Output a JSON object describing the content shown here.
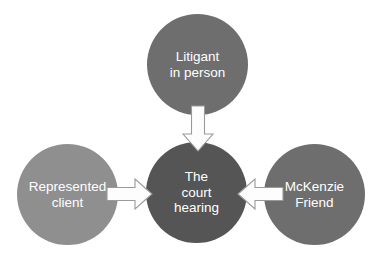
{
  "diagram": {
    "background_color": "#ffffff",
    "text_color": "#ffffff",
    "nodes": [
      {
        "id": "litigant",
        "label": "Litigant in person",
        "line1": "Litigant",
        "line2": "in person",
        "line3": "",
        "color": "#6e6e6e",
        "position": "top"
      },
      {
        "id": "represented",
        "label": "Represented client",
        "line1": "Represented",
        "line2": "client",
        "line3": "",
        "color": "#8f8f8f",
        "position": "left"
      },
      {
        "id": "court",
        "label": "The court hearing",
        "line1": "The",
        "line2": "court",
        "line3": "hearing",
        "color": "#555555",
        "position": "center"
      },
      {
        "id": "mckenzie",
        "label": "McKenzie Friend",
        "line1": "McKenzie",
        "line2": "Friend",
        "line3": "",
        "color": "#6e6e6e",
        "position": "right"
      }
    ],
    "arrows": [
      {
        "id": "arrow-litigant-to-court",
        "from": "litigant",
        "to": "court",
        "direction": "down",
        "fill": "#fdfdfd",
        "outline": "#9a9a9a"
      },
      {
        "id": "arrow-represented-to-court",
        "from": "represented",
        "to": "court",
        "direction": "right",
        "fill": "#fdfdfd",
        "outline": "#9a9a9a"
      },
      {
        "id": "arrow-mckenzie-to-court",
        "from": "mckenzie",
        "to": "court",
        "direction": "left",
        "fill": "#fdfdfd",
        "outline": "#9a9a9a"
      }
    ]
  }
}
